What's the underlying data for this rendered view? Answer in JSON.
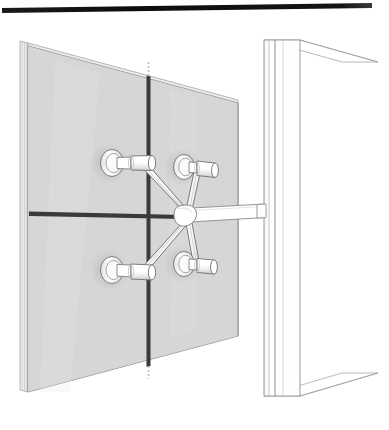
{
  "figure": {
    "background_color": "#ffffff",
    "view": "three-quarter perspective, viewed from the interior side"
  },
  "palette": {
    "outline": "#5a5a5a",
    "outline_light": "#9a9a9a",
    "outline_hairline": "#b8b8b8",
    "glass_fill": "#d8d8d8",
    "glass_fill_highlight": "#e2e2e2",
    "glass_edge_fill": "#eeeeee",
    "joint_dark": "#3a3a3a",
    "joint_darkest": "#2b2b2b",
    "metal_fill": "#ffffff",
    "metal_shadow": "#cfcfcf",
    "metal_midtone": "#e8e8e8",
    "mullion_fill": "#ffffff",
    "top_rule": "#111111",
    "shadow_halo": "#c6c6c6"
  },
  "top_rule": {
    "name": "header-rule",
    "left_x": 2,
    "left_y": 10,
    "right_x": 372,
    "right_y": 5,
    "thickness": 4,
    "color": "#111111"
  },
  "glass_panel": {
    "name": "glass-facade-panel",
    "description": "Two-by-two arrangement of laminated glass panes seen in perspective",
    "fill": "#d8d8d8",
    "corners": {
      "top_left_x": 28,
      "top_left_y": 43,
      "top_right_x": 238,
      "top_right_y": 100,
      "bottom_right_x": 238,
      "bottom_right_y": 336,
      "bottom_left_x": 28,
      "bottom_left_y": 392
    },
    "edge_thickness_lines": 4,
    "edge_band_width": 8,
    "panes_across": 2,
    "panes_down": 2,
    "joints": [
      {
        "name": "vertical-joint",
        "orientation": "vertical",
        "top_x": 148,
        "top_y": 76,
        "bottom_x": 148,
        "bottom_y": 366,
        "width": 3,
        "color": "#3a3a3a"
      },
      {
        "name": "horizontal-joint",
        "orientation": "horizontal",
        "left_x": 30,
        "left_y": 214,
        "right_x": 180,
        "right_y": 216,
        "width": 4,
        "color": "#3a3a3a"
      }
    ]
  },
  "spider_fitting": {
    "name": "four-arm-spider-bracket",
    "arm_count": 4,
    "hub": {
      "name": "spider-hub",
      "center_x": 186,
      "center_y": 216,
      "radius": 9,
      "fill": "#ffffff"
    },
    "support_arm": {
      "name": "horizontal-support-arm",
      "start_x": 186,
      "start_y": 216,
      "end_x": 264,
      "end_y": 210,
      "height": 13,
      "fill": "#ffffff",
      "connects_to": "mullion"
    },
    "routels": [
      {
        "name": "routel-top-left",
        "position": "top-left",
        "disc_x": 112,
        "disc_y": 162,
        "disc_rx": 11,
        "disc_ry": 13,
        "barrel_end_x": 152,
        "barrel_end_y": 163,
        "barrel_radius": 7
      },
      {
        "name": "routel-top-right",
        "position": "top-right",
        "disc_x": 185,
        "disc_y": 166,
        "disc_rx": 10,
        "disc_ry": 12,
        "barrel_end_x": 215,
        "barrel_end_y": 172,
        "barrel_radius": 7
      },
      {
        "name": "routel-bottom-left",
        "position": "bottom-left",
        "disc_x": 112,
        "disc_y": 269,
        "disc_rx": 11,
        "disc_ry": 13,
        "barrel_end_x": 152,
        "barrel_end_y": 272,
        "barrel_radius": 7
      },
      {
        "name": "routel-bottom-right",
        "position": "bottom-right",
        "disc_x": 185,
        "disc_y": 263,
        "disc_rx": 10,
        "disc_ry": 12,
        "barrel_end_x": 213,
        "barrel_end_y": 265,
        "barrel_radius": 7
      }
    ],
    "arms": [
      {
        "name": "spider-arm-upper-left",
        "from": "hub",
        "to": "routel-top-left",
        "width_at_hub": 9,
        "width_at_tip": 4
      },
      {
        "name": "spider-arm-upper-right",
        "from": "hub",
        "to": "routel-top-right",
        "width_at_hub": 8,
        "width_at_tip": 4
      },
      {
        "name": "spider-arm-lower-left",
        "from": "hub",
        "to": "routel-bottom-left",
        "width_at_hub": 9,
        "width_at_tip": 4
      },
      {
        "name": "spider-arm-lower-right",
        "from": "hub",
        "to": "routel-bottom-right",
        "width_at_hub": 8,
        "width_at_tip": 4
      }
    ]
  },
  "mullion": {
    "name": "structural-mullion",
    "description": "Vertical steel mullion shown in perspective with visible top and bottom faces",
    "front_left_x": 264,
    "front_right_x": 300,
    "top_y": 40,
    "bottom_y": 396,
    "fill": "#ffffff",
    "top_face": {
      "far_x": 378,
      "far_y": 62
    },
    "bottom_face": {
      "far_x": 378,
      "far_y": 373
    },
    "face_lines_x": [
      269,
      275,
      283
    ]
  }
}
